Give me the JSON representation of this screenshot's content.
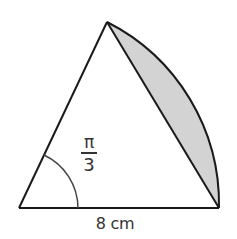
{
  "diagram": {
    "type": "sector-with-segment",
    "angle_label": {
      "numerator": "π",
      "denominator": "3"
    },
    "base_label": "8 cm",
    "colors": {
      "stroke": "#1a1a1a",
      "segment_fill": "#d3d3d3",
      "background": "#ffffff",
      "angle_arc": "#444444"
    },
    "shapes": {
      "triangle": {
        "vertices": [
          [
            19,
            208
          ],
          [
            107,
            22
          ],
          [
            219,
            208
          ]
        ]
      },
      "sector_arc": {
        "center": [
          19,
          208
        ],
        "radius": 204,
        "from": [
          107,
          22
        ],
        "to": [
          219,
          208
        ]
      },
      "angle_marker": {
        "center": [
          19,
          208
        ],
        "radius": 59
      },
      "shaded_region": "minor segment between chord and arc"
    }
  }
}
